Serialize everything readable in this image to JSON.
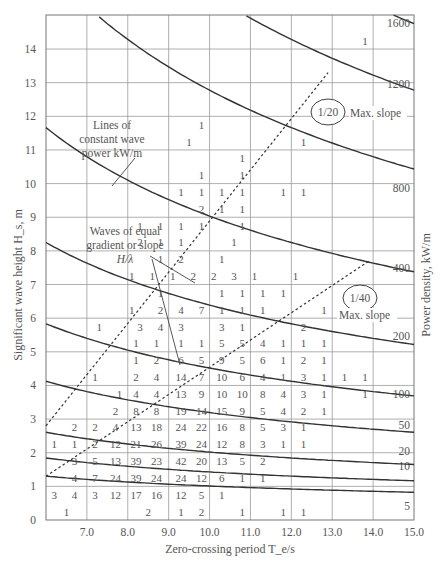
{
  "chart_data": {
    "type": "table",
    "subtype": "scatter-diagram with power-density contours",
    "title": "",
    "xlabel": "Zero-crossing period T_e/s",
    "ylabel": "Significant wave height H_s, m",
    "y2label": "Power density, kW/m",
    "xlim": [
      6.0,
      15.0
    ],
    "ylim": [
      0,
      15
    ],
    "xticks": [
      "7.0",
      "8.0",
      "9.0",
      "10.0",
      "11.0",
      "12.0",
      "13.0",
      "14.0",
      "15.0"
    ],
    "yticks": [
      "0",
      "1",
      "2",
      "3",
      "4",
      "5",
      "6",
      "7",
      "8",
      "9",
      "10",
      "11",
      "12",
      "13",
      "14"
    ],
    "grid": true,
    "power_contours_kW_per_m": [
      "5",
      "10",
      "20",
      "50",
      "100",
      "200",
      "400",
      "800",
      "1200",
      "1600"
    ],
    "annotations": {
      "lines_label": [
        "Lines of",
        "constant wave",
        "power kW/m"
      ],
      "slope_label": [
        "Waves of equal",
        "gradient or slope",
        "H/λ"
      ],
      "slope_20": "1/20",
      "slope_40": "1/40",
      "max_slope": "Max. slope"
    },
    "cells": [
      {
        "T": 6.5,
        "H": 0.25,
        "v": "1"
      },
      {
        "T": 8.5,
        "H": 0.25,
        "v": "2"
      },
      {
        "T": 9.3,
        "H": 0.25,
        "v": "1"
      },
      {
        "T": 9.8,
        "H": 0.25,
        "v": "2"
      },
      {
        "T": 10.8,
        "H": 0.25,
        "v": "1"
      },
      {
        "T": 11.8,
        "H": 0.25,
        "v": "1"
      },
      {
        "T": 12.3,
        "H": 0.25,
        "v": "1"
      },
      {
        "T": 6.2,
        "H": 0.75,
        "v": "3"
      },
      {
        "T": 6.7,
        "H": 0.75,
        "v": "4"
      },
      {
        "T": 7.2,
        "H": 0.75,
        "v": "3"
      },
      {
        "T": 7.7,
        "H": 0.75,
        "v": "12"
      },
      {
        "T": 8.2,
        "H": 0.75,
        "v": "17"
      },
      {
        "T": 8.7,
        "H": 0.75,
        "v": "16"
      },
      {
        "T": 9.3,
        "H": 0.75,
        "v": "12"
      },
      {
        "T": 9.8,
        "H": 0.75,
        "v": "5"
      },
      {
        "T": 10.3,
        "H": 0.75,
        "v": "1"
      },
      {
        "T": 6.7,
        "H": 1.25,
        "v": "4"
      },
      {
        "T": 7.2,
        "H": 1.25,
        "v": "7"
      },
      {
        "T": 7.7,
        "H": 1.25,
        "v": "24"
      },
      {
        "T": 8.2,
        "H": 1.25,
        "v": "39"
      },
      {
        "T": 8.7,
        "H": 1.25,
        "v": "24"
      },
      {
        "T": 9.3,
        "H": 1.25,
        "v": "24"
      },
      {
        "T": 9.8,
        "H": 1.25,
        "v": "12"
      },
      {
        "T": 10.3,
        "H": 1.25,
        "v": "6"
      },
      {
        "T": 10.8,
        "H": 1.25,
        "v": "1"
      },
      {
        "T": 11.3,
        "H": 1.25,
        "v": "1"
      },
      {
        "T": 6.7,
        "H": 1.75,
        "v": "3"
      },
      {
        "T": 7.2,
        "H": 1.75,
        "v": "5"
      },
      {
        "T": 7.7,
        "H": 1.75,
        "v": "13"
      },
      {
        "T": 8.2,
        "H": 1.75,
        "v": "39"
      },
      {
        "T": 8.7,
        "H": 1.75,
        "v": "23"
      },
      {
        "T": 9.3,
        "H": 1.75,
        "v": "42"
      },
      {
        "T": 9.8,
        "H": 1.75,
        "v": "20"
      },
      {
        "T": 10.3,
        "H": 1.75,
        "v": "13"
      },
      {
        "T": 10.8,
        "H": 1.75,
        "v": "5"
      },
      {
        "T": 11.3,
        "H": 1.75,
        "v": "2"
      },
      {
        "T": 6.2,
        "H": 2.25,
        "v": "1"
      },
      {
        "T": 6.7,
        "H": 2.25,
        "v": "1"
      },
      {
        "T": 7.2,
        "H": 2.25,
        "v": "2"
      },
      {
        "T": 7.7,
        "H": 2.25,
        "v": "12"
      },
      {
        "T": 8.2,
        "H": 2.25,
        "v": "21"
      },
      {
        "T": 8.7,
        "H": 2.25,
        "v": "26"
      },
      {
        "T": 9.3,
        "H": 2.25,
        "v": "39"
      },
      {
        "T": 9.8,
        "H": 2.25,
        "v": "24"
      },
      {
        "T": 10.3,
        "H": 2.25,
        "v": "12"
      },
      {
        "T": 10.8,
        "H": 2.25,
        "v": "8"
      },
      {
        "T": 11.3,
        "H": 2.25,
        "v": "3"
      },
      {
        "T": 11.8,
        "H": 2.25,
        "v": "1"
      },
      {
        "T": 12.3,
        "H": 2.25,
        "v": "1"
      },
      {
        "T": 6.7,
        "H": 2.75,
        "v": "2"
      },
      {
        "T": 7.2,
        "H": 2.75,
        "v": "2"
      },
      {
        "T": 7.7,
        "H": 2.75,
        "v": "4"
      },
      {
        "T": 8.2,
        "H": 2.75,
        "v": "13"
      },
      {
        "T": 8.7,
        "H": 2.75,
        "v": "18"
      },
      {
        "T": 9.3,
        "H": 2.75,
        "v": "24"
      },
      {
        "T": 9.8,
        "H": 2.75,
        "v": "22"
      },
      {
        "T": 10.3,
        "H": 2.75,
        "v": "16"
      },
      {
        "T": 10.8,
        "H": 2.75,
        "v": "8"
      },
      {
        "T": 11.3,
        "H": 2.75,
        "v": "5"
      },
      {
        "T": 11.8,
        "H": 2.75,
        "v": "3"
      },
      {
        "T": 12.3,
        "H": 2.75,
        "v": "1"
      },
      {
        "T": 7.7,
        "H": 3.25,
        "v": "2"
      },
      {
        "T": 8.2,
        "H": 3.25,
        "v": "8"
      },
      {
        "T": 8.7,
        "H": 3.25,
        "v": "8"
      },
      {
        "T": 9.3,
        "H": 3.25,
        "v": "19"
      },
      {
        "T": 9.8,
        "H": 3.25,
        "v": "14"
      },
      {
        "T": 10.3,
        "H": 3.25,
        "v": "15"
      },
      {
        "T": 10.8,
        "H": 3.25,
        "v": "9"
      },
      {
        "T": 11.3,
        "H": 3.25,
        "v": "5"
      },
      {
        "T": 11.8,
        "H": 3.25,
        "v": "4"
      },
      {
        "T": 12.3,
        "H": 3.25,
        "v": "2"
      },
      {
        "T": 12.8,
        "H": 3.25,
        "v": "1"
      },
      {
        "T": 7.8,
        "H": 3.75,
        "v": "1"
      },
      {
        "T": 8.2,
        "H": 3.75,
        "v": "4"
      },
      {
        "T": 8.7,
        "H": 3.75,
        "v": "4"
      },
      {
        "T": 9.3,
        "H": 3.75,
        "v": "13"
      },
      {
        "T": 9.8,
        "H": 3.75,
        "v": "9"
      },
      {
        "T": 10.3,
        "H": 3.75,
        "v": "10"
      },
      {
        "T": 10.8,
        "H": 3.75,
        "v": "10"
      },
      {
        "T": 11.3,
        "H": 3.75,
        "v": "8"
      },
      {
        "T": 11.8,
        "H": 3.75,
        "v": "4"
      },
      {
        "T": 12.3,
        "H": 3.75,
        "v": "3"
      },
      {
        "T": 12.8,
        "H": 3.75,
        "v": "1"
      },
      {
        "T": 13.8,
        "H": 3.75,
        "v": "1"
      },
      {
        "T": 7.2,
        "H": 4.25,
        "v": "1"
      },
      {
        "T": 8.2,
        "H": 4.25,
        "v": "2"
      },
      {
        "T": 8.7,
        "H": 4.25,
        "v": "4"
      },
      {
        "T": 9.3,
        "H": 4.25,
        "v": "14"
      },
      {
        "T": 9.8,
        "H": 4.25,
        "v": "7"
      },
      {
        "T": 10.3,
        "H": 4.25,
        "v": "10"
      },
      {
        "T": 10.8,
        "H": 4.25,
        "v": "6"
      },
      {
        "T": 11.3,
        "H": 4.25,
        "v": "4"
      },
      {
        "T": 11.8,
        "H": 4.25,
        "v": "1"
      },
      {
        "T": 12.3,
        "H": 4.25,
        "v": "3"
      },
      {
        "T": 12.8,
        "H": 4.25,
        "v": "1"
      },
      {
        "T": 13.3,
        "H": 4.25,
        "v": "1"
      },
      {
        "T": 13.8,
        "H": 4.25,
        "v": "1"
      },
      {
        "T": 8.2,
        "H": 4.75,
        "v": "1"
      },
      {
        "T": 8.7,
        "H": 4.75,
        "v": "2"
      },
      {
        "T": 9.3,
        "H": 4.75,
        "v": "6"
      },
      {
        "T": 9.8,
        "H": 4.75,
        "v": "5"
      },
      {
        "T": 10.3,
        "H": 4.75,
        "v": "9"
      },
      {
        "T": 10.8,
        "H": 4.75,
        "v": "5"
      },
      {
        "T": 11.3,
        "H": 4.75,
        "v": "6"
      },
      {
        "T": 11.8,
        "H": 4.75,
        "v": "1"
      },
      {
        "T": 12.3,
        "H": 4.75,
        "v": "2"
      },
      {
        "T": 12.8,
        "H": 4.75,
        "v": "1"
      },
      {
        "T": 8.2,
        "H": 5.25,
        "v": "1"
      },
      {
        "T": 8.7,
        "H": 5.25,
        "v": "1"
      },
      {
        "T": 9.3,
        "H": 5.25,
        "v": "1"
      },
      {
        "T": 9.8,
        "H": 5.25,
        "v": "1"
      },
      {
        "T": 10.3,
        "H": 5.25,
        "v": "5"
      },
      {
        "T": 10.8,
        "H": 5.25,
        "v": "5"
      },
      {
        "T": 11.3,
        "H": 5.25,
        "v": "4"
      },
      {
        "T": 11.8,
        "H": 5.25,
        "v": "1"
      },
      {
        "T": 12.3,
        "H": 5.25,
        "v": "1"
      },
      {
        "T": 12.8,
        "H": 5.25,
        "v": "1"
      },
      {
        "T": 7.3,
        "H": 5.75,
        "v": "1"
      },
      {
        "T": 8.3,
        "H": 5.75,
        "v": "3"
      },
      {
        "T": 8.8,
        "H": 5.75,
        "v": "4"
      },
      {
        "T": 9.3,
        "H": 5.75,
        "v": "3"
      },
      {
        "T": 10.3,
        "H": 5.75,
        "v": "3"
      },
      {
        "T": 10.8,
        "H": 5.75,
        "v": "1"
      },
      {
        "T": 12.3,
        "H": 5.75,
        "v": "2"
      },
      {
        "T": 8.1,
        "H": 6.25,
        "v": "1"
      },
      {
        "T": 8.8,
        "H": 6.25,
        "v": "2"
      },
      {
        "T": 9.3,
        "H": 6.25,
        "v": "4"
      },
      {
        "T": 9.8,
        "H": 6.25,
        "v": "7"
      },
      {
        "T": 10.3,
        "H": 6.25,
        "v": "1"
      },
      {
        "T": 10.8,
        "H": 6.25,
        "v": "1"
      },
      {
        "T": 11.3,
        "H": 6.25,
        "v": "1"
      },
      {
        "T": 12.8,
        "H": 6.25,
        "v": "1"
      },
      {
        "T": 8.8,
        "H": 6.75,
        "v": "1"
      },
      {
        "T": 10.3,
        "H": 6.75,
        "v": "1"
      },
      {
        "T": 10.8,
        "H": 6.75,
        "v": "1"
      },
      {
        "T": 11.3,
        "H": 6.75,
        "v": "1"
      },
      {
        "T": 11.8,
        "H": 6.75,
        "v": "1"
      },
      {
        "T": 8.1,
        "H": 7.25,
        "v": "1"
      },
      {
        "T": 8.6,
        "H": 7.25,
        "v": "1"
      },
      {
        "T": 9.1,
        "H": 7.25,
        "v": "1"
      },
      {
        "T": 9.6,
        "H": 7.25,
        "v": "2"
      },
      {
        "T": 10.1,
        "H": 7.25,
        "v": "2"
      },
      {
        "T": 10.6,
        "H": 7.25,
        "v": "3"
      },
      {
        "T": 11.1,
        "H": 7.25,
        "v": "1"
      },
      {
        "T": 12.1,
        "H": 7.25,
        "v": "1"
      },
      {
        "T": 8.8,
        "H": 7.75,
        "v": "1"
      },
      {
        "T": 9.3,
        "H": 7.75,
        "v": "2"
      },
      {
        "T": 10.3,
        "H": 7.75,
        "v": "1"
      },
      {
        "T": 8.3,
        "H": 8.25,
        "v": "2"
      },
      {
        "T": 8.8,
        "H": 8.25,
        "v": "1"
      },
      {
        "T": 9.3,
        "H": 8.25,
        "v": "1"
      },
      {
        "T": 10.6,
        "H": 8.25,
        "v": "1"
      },
      {
        "T": 8.3,
        "H": 8.75,
        "v": "1"
      },
      {
        "T": 8.8,
        "H": 8.75,
        "v": "1"
      },
      {
        "T": 9.3,
        "H": 8.75,
        "v": "1"
      },
      {
        "T": 9.8,
        "H": 8.75,
        "v": "1"
      },
      {
        "T": 10.8,
        "H": 8.75,
        "v": "1"
      },
      {
        "T": 9.8,
        "H": 9.25,
        "v": "2"
      },
      {
        "T": 10.3,
        "H": 9.25,
        "v": "1"
      },
      {
        "T": 10.8,
        "H": 9.25,
        "v": "1"
      },
      {
        "T": 9.3,
        "H": 9.75,
        "v": "1"
      },
      {
        "T": 9.8,
        "H": 9.75,
        "v": "1"
      },
      {
        "T": 10.3,
        "H": 9.75,
        "v": "1"
      },
      {
        "T": 10.8,
        "H": 9.75,
        "v": "1"
      },
      {
        "T": 11.8,
        "H": 9.75,
        "v": "1"
      },
      {
        "T": 12.3,
        "H": 9.75,
        "v": "1"
      },
      {
        "T": 9.8,
        "H": 10.25,
        "v": "1"
      },
      {
        "T": 10.8,
        "H": 10.25,
        "v": "1"
      },
      {
        "T": 10.8,
        "H": 10.75,
        "v": "1"
      },
      {
        "T": 9.5,
        "H": 11.25,
        "v": "1"
      },
      {
        "T": 12.3,
        "H": 11.25,
        "v": "1"
      },
      {
        "T": 9.8,
        "H": 11.75,
        "v": "1"
      },
      {
        "T": 13.8,
        "H": 14.25,
        "v": "1"
      }
    ]
  }
}
